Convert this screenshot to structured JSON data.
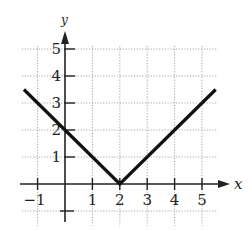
{
  "chart_data": {
    "type": "line",
    "title": "",
    "xlabel": "x",
    "ylabel": "y",
    "function": "y = |x - 2|",
    "xlim": [
      -1.5,
      5.5
    ],
    "ylim": [
      -1,
      5
    ],
    "grid": true,
    "grid_style": "dotted",
    "legend": null,
    "x_ticks": [
      -1,
      1,
      2,
      3,
      4,
      5
    ],
    "x_tick_labels": [
      "−1",
      "1",
      "2",
      "3",
      "4",
      "5"
    ],
    "y_ticks": [
      1,
      2,
      3,
      4,
      5
    ],
    "y_tick_labels": [
      "1",
      "2",
      "3",
      "4",
      "5"
    ],
    "series": [
      {
        "name": "y = |x - 2|",
        "x": [
          -1.5,
          0,
          2,
          4,
          5.5
        ],
        "y": [
          3.5,
          2,
          0,
          2,
          3.5
        ],
        "color": "#111111"
      }
    ],
    "vertex": [
      2,
      0
    ]
  },
  "axes": {
    "x_label": "x",
    "y_label": "y"
  },
  "colors": {
    "curve": "#111111",
    "axis": "#222222",
    "grid": "#a8a8a8",
    "background": "#ffffff"
  }
}
